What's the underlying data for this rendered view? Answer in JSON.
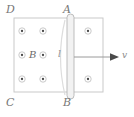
{
  "figure": {
    "width": 134,
    "height": 117,
    "background_color": "#ffffff",
    "description_type": "physics-diagram"
  },
  "field_region": {
    "name": "magnetic-field-region",
    "border_color": "#c9c9c9",
    "fill_color": "#ffffff",
    "x": 14,
    "y": 18,
    "width": 89,
    "height": 74
  },
  "corner_labels": [
    {
      "id": "D",
      "text": "D",
      "x": 6,
      "y": 4
    },
    {
      "id": "A",
      "text": "A",
      "x": 64,
      "y": 4
    },
    {
      "id": "C",
      "text": "C",
      "x": 6,
      "y": 98
    },
    {
      "id": "B",
      "text": "B",
      "x": 64,
      "y": 98
    }
  ],
  "field_label": {
    "text": "B",
    "x": 29,
    "y": 50
  },
  "length_label": {
    "text": "l",
    "x": 58,
    "y": 50
  },
  "velocity_label": {
    "text": "v",
    "x": 122,
    "y": 51
  },
  "rod": {
    "name": "conducting-rod",
    "fill_color": "#f2f2f2",
    "stroke_color": "#b5b5b5",
    "x": 67,
    "y": 14,
    "width": 7,
    "height": 85,
    "corner_radius": 3.5
  },
  "velocity_arrow": {
    "color": "#9a9a9a",
    "x1": 74,
    "y1": 57,
    "x2": 118,
    "y2": 57,
    "direction": "right"
  },
  "field_dots": {
    "symbol": "dot-in-circle",
    "circle_color": "#bdbdbd",
    "dot_color": "#4a4a4a",
    "radius": 3.2,
    "points": [
      {
        "x": 22,
        "y": 31
      },
      {
        "x": 43,
        "y": 31
      },
      {
        "x": 88,
        "y": 31
      },
      {
        "x": 22,
        "y": 55
      },
      {
        "x": 43,
        "y": 55
      },
      {
        "x": 22,
        "y": 79
      },
      {
        "x": 43,
        "y": 79
      },
      {
        "x": 88,
        "y": 79
      }
    ]
  },
  "arc": {
    "name": "flux-arc",
    "color": "#dddddd",
    "path": "M 65 20 Q 56 57 65 95"
  },
  "colors": {
    "line": "#c9c9c9",
    "text": "#6e6e6e",
    "dot": "#4a4a4a"
  }
}
